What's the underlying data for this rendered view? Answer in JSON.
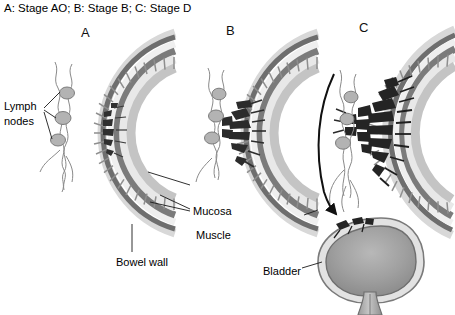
{
  "figure": {
    "caption": "A: Stage AO; B: Stage B; C: Stage D",
    "width": 455,
    "height": 315,
    "background": "#ffffff"
  },
  "panels": [
    {
      "letter": "A",
      "stage": "Stage AO",
      "description": "bowel wall cross-section with tumor confined to mucosa"
    },
    {
      "letter": "B",
      "stage": "Stage B",
      "description": "bowel wall cross-section with tumor invading muscle layer"
    },
    {
      "letter": "C",
      "stage": "Stage D",
      "description": "bowel wall cross-section with tumor spread through wall to bladder"
    }
  ],
  "annotations": {
    "lymph_nodes": "Lymph\nnodes",
    "lymph_nodes_line1": "Lymph",
    "lymph_nodes_line2": "nodes",
    "mucosa": "Mucosa",
    "muscle": "Muscle",
    "bowel_wall": "Bowel wall",
    "bladder": "Bladder"
  },
  "colors": {
    "text": "#000000",
    "outline": "#4a4a4a",
    "serosa_dark": "#6e6e6e",
    "muscle_dark": "#7a7a7a",
    "submucosa_light": "#e4e4e4",
    "mucosa_mid": "#bdbdbd",
    "villi": "#c9c9c9",
    "tumor_dark": "#2b2b2b",
    "lymph_node_fill": "#b5b5b5",
    "bladder_wall": "#dcdcdc",
    "bladder_lumen": "#9e9e9e",
    "background": "#ffffff",
    "arrow": "#111111"
  }
}
